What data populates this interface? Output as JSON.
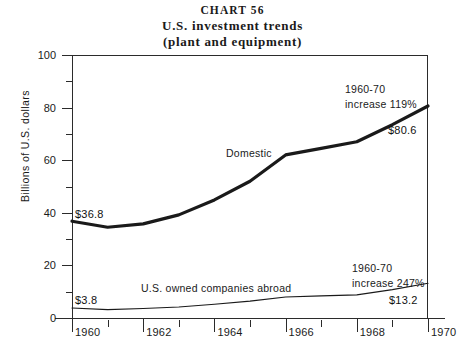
{
  "title": {
    "chart_number": "CHART 56",
    "main": "U.S. investment trends",
    "sub": "(plant and equipment)"
  },
  "axes": {
    "y_axis_title": "Billions of U.S. dollars",
    "y_ticks": [
      "0",
      "20",
      "40",
      "60",
      "80",
      "100"
    ],
    "x_ticks": [
      "1960",
      "1962",
      "1964",
      "1966",
      "1968",
      "1970"
    ]
  },
  "annotations": {
    "domestic_series_label": "Domestic",
    "abroad_series_label": "U.S. owned companies abroad",
    "domestic_growth_line1": "1960-70",
    "domestic_growth_line2": "increase 119%",
    "abroad_growth_line1": "1960-70",
    "abroad_growth_line2": "increase 247%",
    "domestic_start_value": "$36.8",
    "domestic_end_value": "$80.6",
    "abroad_start_value": "$3.8",
    "abroad_end_value": "$13.2"
  },
  "chart_data": {
    "type": "line",
    "title": "U.S. investment trends (plant and equipment)",
    "xlabel": "",
    "ylabel": "Billions of U.S. dollars",
    "xlim": [
      1960,
      1970
    ],
    "ylim": [
      0,
      100
    ],
    "grid": false,
    "legend": "inline-labels",
    "x": [
      1960,
      1961,
      1962,
      1963,
      1964,
      1965,
      1966,
      1967,
      1968,
      1969,
      1970
    ],
    "series": [
      {
        "name": "Domestic",
        "line_weight": "thick",
        "color": "#1a1a1a",
        "values": [
          36.8,
          34.5,
          35.8,
          39.2,
          44.9,
          52.0,
          62.0,
          64.5,
          67.0,
          73.5,
          80.6
        ]
      },
      {
        "name": "U.S. owned companies abroad",
        "line_weight": "thin",
        "color": "#1a1a1a",
        "values": [
          3.8,
          3.2,
          3.6,
          4.2,
          5.2,
          6.4,
          8.0,
          8.4,
          8.8,
          10.8,
          13.2
        ]
      }
    ]
  }
}
